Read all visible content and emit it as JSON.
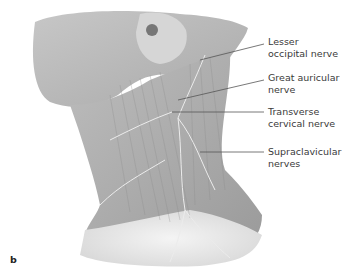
{
  "figure": {
    "panel_label": "b",
    "labels": [
      {
        "id": "lesser-occipital",
        "line1": "Lesser",
        "line2": "occipital nerve"
      },
      {
        "id": "great-auricular",
        "line1": "Great auricular",
        "line2": "nerve"
      },
      {
        "id": "transverse-cervical",
        "line1": "Transverse",
        "line2": "cervical nerve"
      },
      {
        "id": "supraclavicular",
        "line1": "Supraclavicular",
        "line2": "nerves"
      }
    ],
    "colors": {
      "skin_shade": "#a9a9a9",
      "nerve": "#e8e8e8",
      "leader": "#555555",
      "text": "#3a3a3a"
    }
  }
}
